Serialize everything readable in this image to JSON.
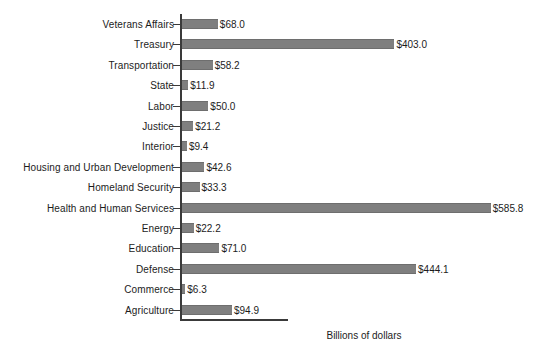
{
  "chart_data": {
    "type": "bar",
    "orientation": "horizontal",
    "title": "",
    "subtitle": "",
    "xlabel": "Billions of dollars",
    "ylabel": "",
    "grid": false,
    "legend": null,
    "xlim": [
      0,
      620
    ],
    "value_prefix": "$",
    "categories": [
      "Veterans Affairs",
      "Treasury",
      "Transportation",
      "State",
      "Labor",
      "Justice",
      "Interior",
      "Housing and Urban Development",
      "Homeland Security",
      "Health and Human Services",
      "Energy",
      "Education",
      "Defense",
      "Commerce",
      "Agriculture"
    ],
    "values": [
      68.0,
      403.0,
      58.2,
      11.9,
      50.0,
      21.2,
      9.4,
      42.6,
      33.3,
      585.8,
      22.2,
      71.0,
      444.1,
      6.3,
      94.9
    ],
    "data_labels": [
      "$68.0",
      "$403.0",
      "$58.2",
      "$11.9",
      "$50.0",
      "$21.2",
      "$9.4",
      "$42.6",
      "$33.3",
      "$585.8",
      "$22.2",
      "$71.0",
      "$444.1",
      "$6.3",
      "$94.9"
    ],
    "bar_color": "#7f7f7f",
    "axis_color": "#3a3a3a",
    "text_color": "#1c1c1c",
    "background": "#ffffff"
  }
}
